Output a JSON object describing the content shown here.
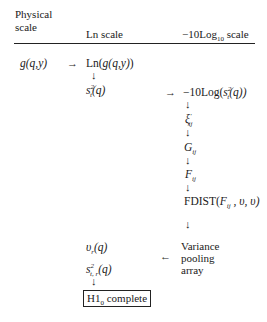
{
  "header": {
    "col1_line1": "Physical",
    "col1_line2": "scale",
    "col2": "Ln scale",
    "col3_prefix": "−10Log",
    "col3_sub": "10",
    "col3_suffix": " scale"
  },
  "nodes": {
    "g": "g(q,y)",
    "ln_g": "Ln(g(q,y))",
    "s2_s": "s",
    "s2_sup": "2",
    "s2_sub": "t",
    "s2_arg": "(q)",
    "neg10log_prefix": "−10Log(",
    "neg10log_suffix": "(q))",
    "xi": "ξ",
    "xi_sup": "′",
    "xi_sub": "ij",
    "G": "G",
    "G_sub": "ij",
    "F": "F",
    "F_sub": "ij",
    "fdist_prefix": "FDIST(",
    "fdist_F": "F",
    "fdist_sub": "ij",
    "fdist_suffix": " , υ, υ)",
    "variance_line1": "Variance",
    "variance_line2": "pooling",
    "variance_line3": "array",
    "nu": "υ",
    "nu_sub": "r",
    "nu_arg": "(q)",
    "s2p_s": "s",
    "s2p_sup": "2",
    "s2p_sub": "t, r",
    "s2p_arg": "(q)",
    "complete_prefix": "H1",
    "complete_sub": "0",
    "complete_suffix": " complete"
  },
  "arrows": {
    "right": "→",
    "left": "←",
    "down": "↓"
  }
}
